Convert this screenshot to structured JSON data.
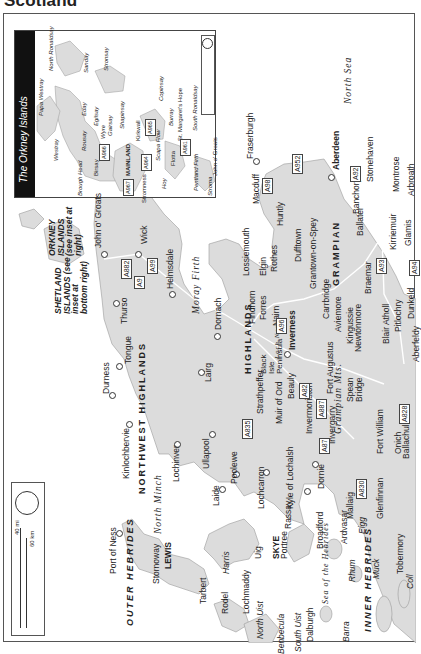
{
  "page": {
    "title": "Scotland"
  },
  "inset": {
    "title": "The Orkney Islands",
    "scale": {
      "mi": "10 mi",
      "km": "16 km",
      "zero": "0"
    },
    "places": [
      {
        "name": "North Ronaldsay"
      },
      {
        "name": "Sanday"
      },
      {
        "name": "Stronsay"
      },
      {
        "name": "Papa Westray"
      },
      {
        "name": "Westray"
      },
      {
        "name": "Eday"
      },
      {
        "name": "Egilsay"
      },
      {
        "name": "Rousay"
      },
      {
        "name": "Wyre"
      },
      {
        "name": "Gairsay"
      },
      {
        "name": "Shapinsay"
      },
      {
        "name": "Copinsay"
      },
      {
        "name": "Kirkwall"
      },
      {
        "name": "MAINLAND"
      },
      {
        "name": "Birsay"
      },
      {
        "name": "Brough Head"
      },
      {
        "name": "Stromness"
      },
      {
        "name": "Scapa Flow"
      },
      {
        "name": "Flotta"
      },
      {
        "name": "Hoy"
      },
      {
        "name": "Burray"
      },
      {
        "name": "St. Margaret's Hope"
      },
      {
        "name": "South Ronaldsay"
      },
      {
        "name": "Pentland Firth"
      },
      {
        "name": "Stroma"
      },
      {
        "name": "John o' Groats"
      }
    ],
    "roads": [
      "A966",
      "A965",
      "A964",
      "A967",
      "A961"
    ]
  },
  "main_map": {
    "scale": {
      "mi": "40 mi",
      "km": "60 km",
      "zero": "0"
    },
    "regions": [
      "NORTHWEST HIGHLANDS",
      "HIGHLANDS",
      "GRAMPIAN",
      "OUTER HEBRIDES",
      "INNER HEBRIDES",
      "SKYE",
      "LEWIS"
    ],
    "mountains": "Grampian Mts.",
    "seas": [
      "North Sea",
      "North Minch",
      "Moray Firth",
      "Sea of the Hebrides",
      "Loch Ness"
    ],
    "notes": {
      "orkney": "ORKNEY ISLANDS (see inset at right)",
      "shetland": "SHETLAND ISLANDS (see inset at bottom right)"
    },
    "towns": [
      "John o' Groats",
      "Wick",
      "Thurso",
      "Helmsdale",
      "Tongue",
      "Durness",
      "Dornach",
      "Lairg",
      "Kinlochbervie",
      "Lochinver",
      "Ullapool",
      "Laide",
      "Poolewe",
      "Lochcarron",
      "Kyle of Lochalsh",
      "Dornie",
      "Strathpeffer",
      "Black Isle Peninsula",
      "Muir of Ord",
      "Beauly",
      "Inverness",
      "Invermoriston",
      "Fort Augustus",
      "Invergarry",
      "Spean Bridge",
      "Fort William",
      "Onich",
      "Ballachulish",
      "Glenfinnan",
      "Mallaig",
      "Tobermory",
      "Fraserburgh",
      "Macduff",
      "Huntly",
      "Lossiemouth",
      "Elgin",
      "Rothes",
      "Dufftown",
      "Findhorn",
      "Forres",
      "Nairn",
      "Grantown-on-Spey",
      "Carrbridge",
      "Aviemore",
      "Kingussie",
      "Newtonmore",
      "Aberdeen",
      "Banchory",
      "Stonehaven",
      "Ballater",
      "Braemar",
      "Kirriemuir",
      "Glamis",
      "Montrose",
      "Arbroath",
      "Blair Atholl",
      "Pitlochry",
      "Dunkeld",
      "Aberfeldy",
      "Port of Ness",
      "Stornoway",
      "Tarbert",
      "Harris",
      "Rodel",
      "Lochmaddy",
      "North Uist",
      "Benbecula",
      "South Uist",
      "Dalburgh",
      "Barra",
      "Uig",
      "Portree",
      "Rassay",
      "Broadford",
      "Ardvasar",
      "Eigg",
      "Rhum",
      "Muck",
      "Coll"
    ],
    "roads": [
      "A882",
      "A99",
      "A9",
      "A835",
      "A96",
      "A82",
      "A887",
      "A87",
      "A830",
      "A828",
      "A98",
      "A952",
      "A92",
      "A93",
      "A94"
    ]
  }
}
